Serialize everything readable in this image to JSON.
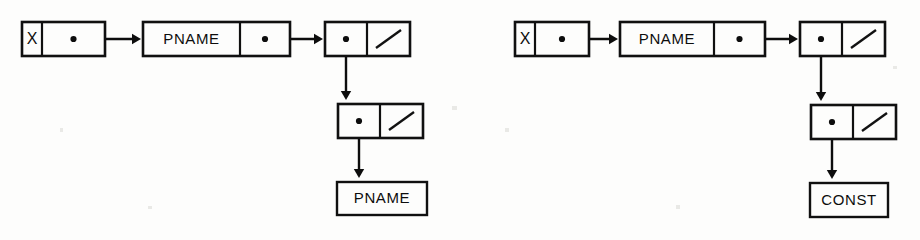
{
  "page": {
    "background_color": "#fdfdfc",
    "ink_color": "#0d0d0d",
    "width": 920,
    "height": 240
  },
  "diagrams": [
    {
      "id": "left-diagram",
      "name": "pname-pname-structure",
      "description": "X points to a chain ending in a two-cell node whose car points to a node whose car points to PNAME",
      "nodes": [
        {
          "id": "left-var-node",
          "name": "variable-node",
          "type": "two-cell",
          "x": 22,
          "y": 22,
          "width": 83,
          "height": 34,
          "divider_x": 42,
          "cells": [
            {
              "kind": "label",
              "text": "X",
              "name": "variable-name-cell"
            },
            {
              "kind": "pointer",
              "name": "variable-pointer-cell"
            }
          ]
        },
        {
          "id": "left-pname-node",
          "name": "pname-node",
          "type": "two-cell",
          "x": 143,
          "y": 22,
          "width": 147,
          "height": 34,
          "divider_x": 240,
          "cells": [
            {
              "kind": "label",
              "text": "PNAME",
              "name": "pname-label-cell"
            },
            {
              "kind": "pointer",
              "name": "pname-pointer-cell"
            }
          ]
        },
        {
          "id": "left-cons-node-1",
          "name": "cons-node-level-1",
          "type": "two-cell",
          "x": 325,
          "y": 22,
          "width": 85,
          "height": 34,
          "divider_x": 367,
          "cells": [
            {
              "kind": "pointer",
              "name": "car-pointer-cell"
            },
            {
              "kind": "null",
              "name": "cdr-null-cell"
            }
          ]
        },
        {
          "id": "left-cons-node-2",
          "name": "cons-node-level-2",
          "type": "two-cell",
          "x": 338,
          "y": 104,
          "width": 85,
          "height": 34,
          "divider_x": 380,
          "cells": [
            {
              "kind": "pointer",
              "name": "car-pointer-cell"
            },
            {
              "kind": "null",
              "name": "cdr-null-cell"
            }
          ]
        }
      ],
      "terminals": [
        {
          "id": "left-terminal",
          "name": "terminal-pname-box",
          "text": "PNAME",
          "x": 337,
          "y": 182,
          "width": 90,
          "height": 33
        }
      ],
      "links": [
        {
          "name": "link-var-to-pname",
          "from": "left-var-node",
          "direction": "right",
          "x1": 73,
          "y1": 39,
          "x2": 141,
          "y2": 39
        },
        {
          "name": "link-pname-to-cons1",
          "from": "left-pname-node",
          "direction": "right",
          "x1": 265,
          "y1": 39,
          "x2": 323,
          "y2": 39
        },
        {
          "name": "link-cons1-to-cons2",
          "from": "left-cons-node-1",
          "direction": "down",
          "x1": 346,
          "y1": 39,
          "x2": 346,
          "y2": 100
        },
        {
          "name": "link-cons2-to-terminal",
          "from": "left-cons-node-2",
          "direction": "down",
          "x1": 359,
          "y1": 121,
          "x2": 359,
          "y2": 178
        }
      ]
    },
    {
      "id": "right-diagram",
      "name": "pname-const-structure",
      "description": "X points to a chain ending in a two-cell node whose car points to a node whose car points to CONST",
      "nodes": [
        {
          "id": "right-var-node",
          "name": "variable-node",
          "type": "two-cell",
          "x": 515,
          "y": 22,
          "width": 74,
          "height": 34,
          "divider_x": 535,
          "cells": [
            {
              "kind": "label",
              "text": "X",
              "name": "variable-name-cell"
            },
            {
              "kind": "pointer",
              "name": "variable-pointer-cell"
            }
          ]
        },
        {
          "id": "right-pname-node",
          "name": "pname-node",
          "type": "two-cell",
          "x": 620,
          "y": 22,
          "width": 145,
          "height": 34,
          "divider_x": 714,
          "cells": [
            {
              "kind": "label",
              "text": "PNAME",
              "name": "pname-label-cell"
            },
            {
              "kind": "pointer",
              "name": "pname-pointer-cell"
            }
          ]
        },
        {
          "id": "right-cons-node-1",
          "name": "cons-node-level-1",
          "type": "two-cell",
          "x": 800,
          "y": 22,
          "width": 85,
          "height": 34,
          "divider_x": 842,
          "cells": [
            {
              "kind": "pointer",
              "name": "car-pointer-cell"
            },
            {
              "kind": "null",
              "name": "cdr-null-cell"
            }
          ]
        },
        {
          "id": "right-cons-node-2",
          "name": "cons-node-level-2",
          "type": "two-cell",
          "x": 811,
          "y": 105,
          "width": 85,
          "height": 34,
          "divider_x": 853,
          "cells": [
            {
              "kind": "pointer",
              "name": "car-pointer-cell"
            },
            {
              "kind": "null",
              "name": "cdr-null-cell"
            }
          ]
        }
      ],
      "terminals": [
        {
          "id": "right-terminal",
          "name": "terminal-const-box",
          "text": "CONST",
          "x": 810,
          "y": 183,
          "width": 78,
          "height": 34
        }
      ],
      "links": [
        {
          "name": "link-var-to-pname",
          "from": "right-var-node",
          "direction": "right",
          "x1": 562,
          "y1": 39,
          "x2": 618,
          "y2": 39
        },
        {
          "name": "link-pname-to-cons1",
          "from": "right-pname-node",
          "direction": "right",
          "x1": 740,
          "y1": 39,
          "x2": 798,
          "y2": 39
        },
        {
          "name": "link-cons1-to-cons2",
          "from": "right-cons-node-1",
          "direction": "down",
          "x1": 821,
          "y1": 39,
          "x2": 821,
          "y2": 101
        },
        {
          "name": "link-cons2-to-terminal",
          "from": "right-cons-node-2",
          "direction": "down",
          "x1": 832,
          "y1": 122,
          "x2": 832,
          "y2": 179
        }
      ]
    }
  ],
  "specks": [
    {
      "x": 452,
      "y": 106,
      "w": 5,
      "h": 4
    },
    {
      "x": 505,
      "y": 128,
      "w": 4,
      "h": 4
    },
    {
      "x": 148,
      "y": 206,
      "w": 4,
      "h": 3
    },
    {
      "x": 676,
      "y": 205,
      "w": 4,
      "h": 4
    },
    {
      "x": 60,
      "y": 128,
      "w": 3,
      "h": 4
    },
    {
      "x": 893,
      "y": 66,
      "w": 4,
      "h": 3
    }
  ]
}
